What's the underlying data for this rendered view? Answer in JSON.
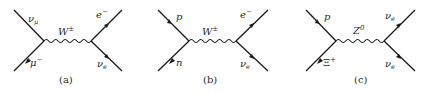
{
  "diagrams": [
    {
      "id": "a",
      "caption": "(a)",
      "boson": {
        "symbol": "W",
        "sup": "±"
      },
      "top_left": {
        "symbol": "ν",
        "sub": "μ"
      },
      "bottom_left": {
        "symbol": "μ",
        "sup": "−"
      },
      "top_right": {
        "symbol": "e",
        "sup": "−"
      },
      "bottom_right": {
        "symbol": "ν",
        "sub": "e"
      }
    },
    {
      "id": "b",
      "caption": "(b)",
      "boson": {
        "symbol": "W",
        "sup": "±"
      },
      "top_left": {
        "symbol": "p",
        "sub": ""
      },
      "bottom_left": {
        "symbol": "n",
        "sup": ""
      },
      "top_right": {
        "symbol": "e",
        "sup": "−"
      },
      "bottom_right": {
        "symbol": "ν",
        "sub": "e"
      }
    },
    {
      "id": "c",
      "caption": "(c)",
      "boson": {
        "symbol": "Z",
        "sup": "0"
      },
      "top_left": {
        "symbol": "p",
        "sub": ""
      },
      "bottom_left": {
        "symbol": "Ξ",
        "sup": "+"
      },
      "top_right": {
        "symbol": "ν",
        "sub": "e"
      },
      "bottom_right": {
        "symbol": "ν",
        "sub": "e"
      }
    }
  ],
  "colors": {
    "ink": "#1a1a1a",
    "background": "#ffffff"
  }
}
